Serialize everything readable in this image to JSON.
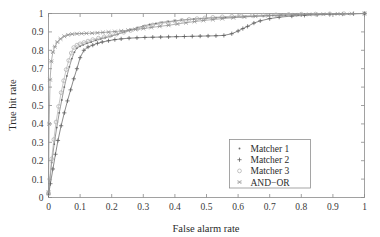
{
  "chart_data": {
    "type": "line",
    "title": "",
    "xlabel": "False alarm rate",
    "ylabel": "True hit rate",
    "xlim": [
      0,
      1
    ],
    "ylim": [
      0,
      1
    ],
    "grid": false,
    "legend_position": "lower-right",
    "xticks": [
      "0",
      "0.1",
      "0.2",
      "0.3",
      "0.4",
      "0.5",
      "0.6",
      "0.7",
      "0.8",
      "0.9",
      "1"
    ],
    "xtick_values": [
      0,
      0.1,
      0.2,
      0.3,
      0.4,
      0.5,
      0.6,
      0.7,
      0.8,
      0.9,
      1
    ],
    "yticks": [
      "0",
      "0.1",
      "0.2",
      "0.3",
      "0.4",
      "0.5",
      "0.6",
      "0.7",
      "0.8",
      "0.9",
      "1"
    ],
    "ytick_values": [
      0,
      0.1,
      0.2,
      0.3,
      0.4,
      0.5,
      0.6,
      0.7,
      0.8,
      0.9,
      1
    ],
    "series": [
      {
        "name": "Matcher 1",
        "marker": "dot",
        "color": "#6e6e6e",
        "x": [
          0.0,
          0.004,
          0.01,
          0.018,
          0.026,
          0.034,
          0.042,
          0.05,
          0.058,
          0.066,
          0.074,
          0.082,
          0.09,
          0.1,
          0.11,
          0.122,
          0.135,
          0.15,
          0.165,
          0.18,
          0.2,
          0.22,
          0.24,
          0.26,
          0.28,
          0.3,
          0.32,
          0.34,
          0.36,
          0.38,
          0.4,
          0.42,
          0.44,
          0.46,
          0.48,
          0.5,
          0.53,
          0.56,
          0.59,
          0.62,
          0.65,
          0.68,
          0.71,
          0.75,
          0.79,
          0.83,
          0.87,
          0.91,
          0.95,
          1.0
        ],
        "y": [
          0.02,
          0.09,
          0.19,
          0.29,
          0.38,
          0.46,
          0.53,
          0.6,
          0.66,
          0.71,
          0.755,
          0.79,
          0.812,
          0.822,
          0.83,
          0.838,
          0.845,
          0.855,
          0.862,
          0.868,
          0.878,
          0.888,
          0.9,
          0.912,
          0.922,
          0.932,
          0.94,
          0.946,
          0.952,
          0.956,
          0.96,
          0.964,
          0.967,
          0.97,
          0.972,
          0.974,
          0.977,
          0.979,
          0.981,
          0.983,
          0.985,
          0.987,
          0.989,
          0.991,
          0.993,
          0.995,
          0.996,
          0.998,
          0.999,
          1.0
        ]
      },
      {
        "name": "Matcher 2",
        "marker": "plus",
        "color": "#595959",
        "x": [
          0.0,
          0.006,
          0.014,
          0.022,
          0.03,
          0.04,
          0.05,
          0.06,
          0.07,
          0.08,
          0.09,
          0.1,
          0.112,
          0.125,
          0.14,
          0.155,
          0.17,
          0.19,
          0.21,
          0.23,
          0.255,
          0.28,
          0.305,
          0.33,
          0.355,
          0.38,
          0.405,
          0.43,
          0.455,
          0.48,
          0.505,
          0.53,
          0.555,
          0.58,
          0.6,
          0.615,
          0.63,
          0.65,
          0.67,
          0.7,
          0.73,
          0.77,
          0.81,
          0.85,
          0.89,
          0.93,
          0.965,
          1.0
        ],
        "y": [
          0.015,
          0.075,
          0.155,
          0.235,
          0.31,
          0.39,
          0.46,
          0.525,
          0.585,
          0.645,
          0.7,
          0.76,
          0.8,
          0.818,
          0.828,
          0.838,
          0.845,
          0.852,
          0.858,
          0.862,
          0.866,
          0.868,
          0.87,
          0.871,
          0.872,
          0.873,
          0.874,
          0.875,
          0.876,
          0.877,
          0.878,
          0.879,
          0.881,
          0.89,
          0.905,
          0.918,
          0.93,
          0.948,
          0.96,
          0.972,
          0.98,
          0.986,
          0.99,
          0.993,
          0.995,
          0.997,
          0.999,
          1.0
        ]
      },
      {
        "name": "Matcher 3",
        "marker": "circle",
        "color": "#b0b0b0",
        "x": [
          0.0,
          0.004,
          0.01,
          0.017,
          0.024,
          0.032,
          0.04,
          0.048,
          0.056,
          0.064,
          0.072,
          0.08,
          0.09,
          0.1,
          0.112,
          0.125,
          0.14,
          0.158,
          0.176,
          0.195,
          0.215,
          0.238,
          0.26,
          0.282,
          0.305,
          0.33,
          0.355,
          0.378,
          0.4,
          0.422,
          0.445,
          0.47,
          0.495,
          0.52,
          0.55,
          0.58,
          0.61,
          0.645,
          0.68,
          0.72,
          0.76,
          0.8,
          0.845,
          0.89,
          0.935,
          1.0
        ],
        "y": [
          0.022,
          0.1,
          0.21,
          0.315,
          0.41,
          0.495,
          0.57,
          0.635,
          0.695,
          0.745,
          0.785,
          0.815,
          0.828,
          0.835,
          0.842,
          0.85,
          0.858,
          0.866,
          0.873,
          0.88,
          0.888,
          0.898,
          0.908,
          0.918,
          0.928,
          0.938,
          0.946,
          0.952,
          0.958,
          0.963,
          0.968,
          0.972,
          0.976,
          0.979,
          0.982,
          0.985,
          0.987,
          0.989,
          0.991,
          0.993,
          0.995,
          0.996,
          0.997,
          0.998,
          0.999,
          1.0
        ]
      },
      {
        "name": "AND−OR",
        "marker": "x",
        "color": "#909090",
        "x": [
          0.0,
          0.002,
          0.005,
          0.009,
          0.014,
          0.02,
          0.028,
          0.038,
          0.05,
          0.062,
          0.075,
          0.09,
          0.105,
          0.12,
          0.138,
          0.155,
          0.172,
          0.19,
          0.21,
          0.23,
          0.252,
          0.275,
          0.3,
          0.325,
          0.352,
          0.38,
          0.408,
          0.435,
          0.462,
          0.49,
          0.52,
          0.55,
          0.585,
          0.62,
          0.655,
          0.695,
          0.735,
          0.78,
          0.825,
          0.87,
          0.915,
          0.96,
          1.0
        ],
        "y": [
          0.03,
          0.4,
          0.64,
          0.74,
          0.79,
          0.82,
          0.845,
          0.862,
          0.876,
          0.884,
          0.888,
          0.89,
          0.891,
          0.892,
          0.893,
          0.895,
          0.897,
          0.899,
          0.902,
          0.905,
          0.909,
          0.913,
          0.918,
          0.924,
          0.93,
          0.936,
          0.943,
          0.95,
          0.956,
          0.962,
          0.967,
          0.972,
          0.977,
          0.981,
          0.985,
          0.988,
          0.991,
          0.993,
          0.995,
          0.996,
          0.998,
          0.999,
          1.0
        ]
      }
    ],
    "legend_entries": [
      {
        "label": "Matcher 1",
        "marker": "dot"
      },
      {
        "label": "Matcher 2",
        "marker": "plus"
      },
      {
        "label": "Matcher 3",
        "marker": "circle"
      },
      {
        "label": "AND−OR",
        "marker": "x"
      }
    ]
  }
}
